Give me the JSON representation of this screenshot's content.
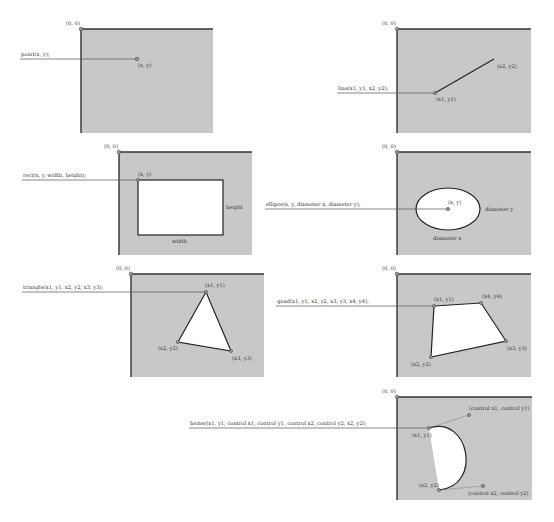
{
  "colors": {
    "panel": "#c8c8c8",
    "axis": "#333333",
    "shape_fill": "#ffffff",
    "shape_stroke": "#222222",
    "point": "#999999"
  },
  "origin_label": "(0, 0)",
  "panels": {
    "point": {
      "call": "point(x, y);",
      "labels": {
        "p": "(x, y)"
      }
    },
    "line": {
      "call": "line(x1, y1, x2, y2);",
      "labels": {
        "p1": "(x1, y1)",
        "p2": "(x2, y2)"
      }
    },
    "rect": {
      "call": "rect(x, y, width, height);",
      "labels": {
        "p": "(x, y)",
        "width": "width",
        "height": "height"
      }
    },
    "ellipse": {
      "call": "ellipse(x, y, diameter x, diameter y);",
      "labels": {
        "p": "(x, y)",
        "dx": "diameter x",
        "dy": "diameter y"
      }
    },
    "triangle": {
      "call": "triangle(x1, y1, x2, y2, x3, y3);",
      "labels": {
        "p1": "(x1, y1)",
        "p2": "(x2, y2)",
        "p3": "(x3, y3)"
      }
    },
    "quad": {
      "call": "quad(x1, y1, x2, y2, x3, y3, x4, y4);",
      "labels": {
        "p1": "(x1, y1)",
        "p2": "(x2, y2)",
        "p3": "(x3, y3)",
        "p4": "(x4, y4)"
      }
    },
    "bezier": {
      "call": "bezier(x1, y1, control x1, control y1, control x2, control y2, x2, y2);",
      "labels": {
        "p1": "(x1, y1)",
        "p2": "(x2, y2)",
        "c1": "(control x1, control y1)",
        "c2": "(control x2, control y2)"
      }
    }
  }
}
